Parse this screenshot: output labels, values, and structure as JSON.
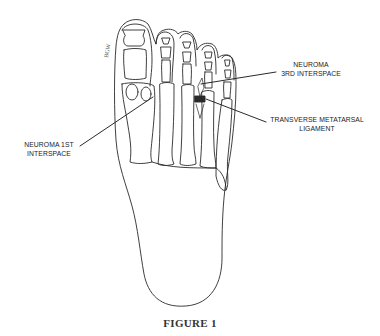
{
  "figure": {
    "caption": "FIGURE 1",
    "signature": "BGW"
  },
  "labels": {
    "neuroma_3rd": {
      "line1": "NEUROMA",
      "line2": "3RD INTERSPACE"
    },
    "transverse_ligament": {
      "line1": "TRANSVERSE METATARSAL",
      "line2": "LIGAMENT"
    },
    "neuroma_1st": {
      "line1": "NEUROMA 1ST",
      "line2": "INTERSPACE"
    }
  },
  "colors": {
    "line": "#2a2a2a",
    "background": "#ffffff"
  }
}
